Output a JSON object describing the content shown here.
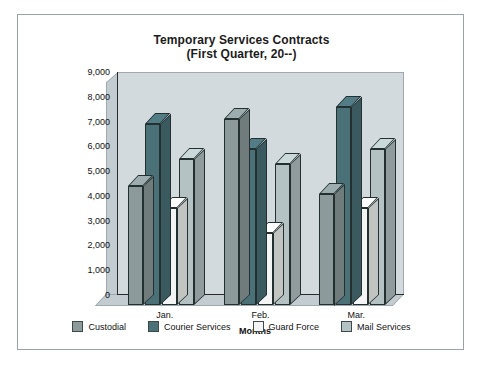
{
  "chart_data": {
    "type": "bar",
    "title": "Temporary Services Contracts",
    "subtitle": "(First Quarter, 20--)",
    "xlabel": "Months",
    "ylabel": "Dollars Spent",
    "categories": [
      "Jan.",
      "Feb.",
      "Mar."
    ],
    "ylim": [
      0,
      9000
    ],
    "yticks": [
      "0",
      "1,000",
      "2,000",
      "3,000",
      "4,000",
      "5,000",
      "6,000",
      "7,000",
      "8,000",
      "9,000"
    ],
    "ytick_values": [
      0,
      1000,
      2000,
      3000,
      4000,
      5000,
      6000,
      7000,
      8000,
      9000
    ],
    "grid": false,
    "legend_position": "bottom",
    "series": [
      {
        "name": "Custodial",
        "color": "#8c9a9b",
        "values": [
          4800,
          7500,
          4500
        ]
      },
      {
        "name": "Courier Services",
        "color": "#4a7078",
        "values": [
          7300,
          6300,
          8000
        ]
      },
      {
        "name": "Guard Force",
        "color": "#f2f5f3",
        "values": [
          3900,
          2900,
          3900
        ]
      },
      {
        "name": "Mail Services",
        "color": "#b4c2c4",
        "values": [
          5900,
          5700,
          6300
        ]
      }
    ]
  },
  "style": {
    "wall_color": "#d3dade",
    "wall_side_color": "#c2ccd1",
    "border_color": "#9aa3a8",
    "text_color": "#111111"
  }
}
